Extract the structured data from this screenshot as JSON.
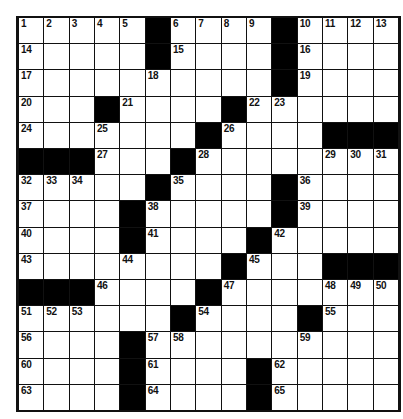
{
  "puzzle": {
    "rows": 15,
    "cols": 15,
    "colors": {
      "block": "#000000",
      "cell": "#ffffff",
      "line": "#111111"
    },
    "grid": [
      [
        "1",
        "2",
        "3",
        "4",
        "5",
        "#",
        "6",
        "7",
        "8",
        "9",
        "#",
        "10",
        "11",
        "12",
        "13"
      ],
      [
        "14",
        ".",
        ".",
        ".",
        ".",
        "#",
        "15",
        ".",
        ".",
        ".",
        "#",
        "16",
        ".",
        ".",
        "."
      ],
      [
        "17",
        ".",
        ".",
        ".",
        ".",
        "18",
        ".",
        ".",
        ".",
        ".",
        "#",
        "19",
        ".",
        ".",
        "."
      ],
      [
        "20",
        ".",
        ".",
        "#",
        "21",
        ".",
        ".",
        ".",
        "#",
        "22",
        "23",
        ".",
        ".",
        ".",
        "."
      ],
      [
        "24",
        ".",
        ".",
        "25",
        ".",
        ".",
        ".",
        "#",
        "26",
        ".",
        ".",
        ".",
        "#",
        "#",
        "#"
      ],
      [
        "#",
        "#",
        "#",
        "27",
        ".",
        ".",
        "#",
        "28",
        ".",
        ".",
        ".",
        ".",
        "29",
        "30",
        "31"
      ],
      [
        "32",
        "33",
        "34",
        ".",
        ".",
        "#",
        "35",
        ".",
        ".",
        ".",
        "#",
        "36",
        ".",
        ".",
        "."
      ],
      [
        "37",
        ".",
        ".",
        ".",
        "#",
        "38",
        ".",
        ".",
        ".",
        ".",
        "#",
        "39",
        ".",
        ".",
        "."
      ],
      [
        "40",
        ".",
        ".",
        ".",
        "#",
        "41",
        ".",
        ".",
        ".",
        "#",
        "42",
        ".",
        ".",
        ".",
        "."
      ],
      [
        "43",
        ".",
        ".",
        ".",
        "44",
        ".",
        ".",
        ".",
        "#",
        "45",
        ".",
        ".",
        "#",
        "#",
        "#"
      ],
      [
        "#",
        "#",
        "#",
        "46",
        ".",
        ".",
        ".",
        "#",
        "47",
        ".",
        ".",
        ".",
        "48",
        "49",
        "50"
      ],
      [
        "51",
        "52",
        "53",
        ".",
        ".",
        ".",
        "#",
        "54",
        ".",
        ".",
        ".",
        "#",
        "55",
        ".",
        "."
      ],
      [
        "56",
        ".",
        ".",
        ".",
        "#",
        "57",
        "58",
        ".",
        ".",
        ".",
        ".",
        "59",
        ".",
        ".",
        "."
      ],
      [
        "60",
        ".",
        ".",
        ".",
        "#",
        "61",
        ".",
        ".",
        ".",
        "#",
        "62",
        ".",
        ".",
        ".",
        "."
      ],
      [
        "63",
        ".",
        ".",
        ".",
        "#",
        "64",
        ".",
        ".",
        ".",
        "#",
        "65",
        ".",
        ".",
        ".",
        "."
      ]
    ]
  }
}
